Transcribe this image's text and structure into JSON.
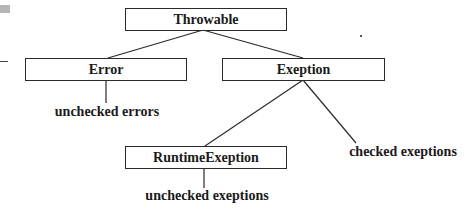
{
  "diagram": {
    "nodes": [
      {
        "id": "throwable",
        "label": "Throwable",
        "type": "class"
      },
      {
        "id": "error",
        "label": "Error",
        "type": "class"
      },
      {
        "id": "exeption",
        "label": "Exeption",
        "type": "class"
      },
      {
        "id": "runtime",
        "label": "RuntimeExeption",
        "type": "class"
      }
    ],
    "annotations": [
      {
        "id": "unchecked-errors",
        "label": "unchecked errors",
        "attached_to": "error"
      },
      {
        "id": "checked-exeptions",
        "label": "checked exeptions",
        "attached_to": "exeption"
      },
      {
        "id": "unchecked-exeptions",
        "label": "unchecked exeptions",
        "attached_to": "runtime"
      }
    ],
    "edges": [
      {
        "from": "throwable",
        "to": "error"
      },
      {
        "from": "throwable",
        "to": "exeption"
      },
      {
        "from": "exeption",
        "to": "runtime"
      },
      {
        "from": "exeption",
        "to": "checked-exeptions"
      },
      {
        "from": "error",
        "to": "unchecked-errors"
      },
      {
        "from": "runtime",
        "to": "unchecked-exeptions"
      }
    ],
    "colors": {
      "line": "#2a2a2a",
      "text": "#1a1a1a",
      "background": "#ffffff"
    }
  }
}
